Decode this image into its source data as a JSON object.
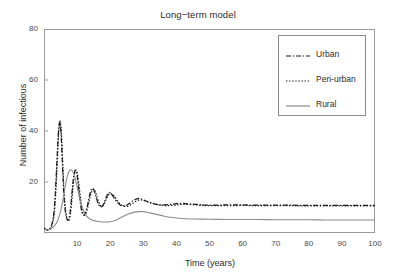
{
  "chart_data": {
    "type": "line",
    "title": "Long−term model",
    "xlabel": "Time (years)",
    "ylabel": "Number of infectious",
    "xlim": [
      0,
      100
    ],
    "ylim": [
      0,
      80
    ],
    "xticks": [
      10,
      20,
      30,
      40,
      50,
      60,
      70,
      80,
      90,
      100
    ],
    "yticks": [
      20,
      40,
      60,
      80
    ],
    "grid": false,
    "legend_position": "top-right",
    "series": [
      {
        "name": "Urban",
        "style": "dash-dot",
        "color": "#1a1a1a",
        "x": [
          0,
          0.5,
          1,
          1.5,
          2,
          2.5,
          3,
          3.3,
          3.6,
          3.9,
          4.2,
          4.5,
          4.8,
          5.1,
          5.4,
          5.7,
          6,
          6.4,
          6.8,
          7.2,
          7.6,
          8,
          8.4,
          8.8,
          9.2,
          9.6,
          10,
          10.5,
          11,
          11.5,
          12,
          12.5,
          13,
          13.5,
          14,
          14.5,
          15,
          15.5,
          16,
          16.5,
          17,
          17.5,
          18,
          18.5,
          19,
          19.5,
          20,
          21,
          22,
          23,
          24,
          25,
          26,
          27,
          28,
          29,
          30,
          32,
          34,
          36,
          38,
          40,
          42,
          45,
          48,
          50,
          55,
          60,
          65,
          70,
          75,
          80,
          85,
          90,
          95,
          100
        ],
        "y": [
          2.0,
          1.5,
          1.2,
          1.4,
          2.2,
          4.0,
          8.0,
          13.0,
          20.0,
          28.0,
          36.0,
          41.5,
          43.5,
          40.0,
          32.0,
          23.0,
          15.0,
          9.0,
          6.0,
          5.0,
          6.0,
          9.5,
          15.0,
          20.5,
          23.8,
          24.6,
          22.5,
          17.0,
          11.5,
          8.0,
          7.0,
          7.8,
          10.0,
          13.0,
          16.0,
          17.4,
          17.0,
          15.2,
          13.0,
          11.2,
          10.3,
          10.4,
          11.4,
          13.0,
          14.6,
          15.6,
          15.8,
          14.2,
          12.3,
          11.0,
          10.6,
          10.9,
          11.8,
          12.8,
          13.4,
          13.5,
          13.0,
          11.9,
          11.2,
          11.0,
          11.2,
          11.5,
          11.6,
          11.3,
          11.0,
          10.9,
          11.0,
          11.0,
          10.9,
          10.9,
          10.9,
          10.8,
          10.8,
          10.8,
          10.8,
          10.8
        ]
      },
      {
        "name": "Peri-urban",
        "style": "dotted",
        "color": "#1a1a1a",
        "x": [
          0,
          0.5,
          1,
          1.5,
          2,
          2.5,
          3,
          3.3,
          3.6,
          3.9,
          4.2,
          4.5,
          4.8,
          5.1,
          5.4,
          5.7,
          6,
          6.4,
          6.8,
          7.2,
          7.6,
          8,
          8.4,
          8.8,
          9.2,
          9.6,
          10,
          10.5,
          11,
          11.5,
          12,
          12.5,
          13,
          13.5,
          14,
          14.5,
          15,
          15.5,
          16,
          16.5,
          17,
          17.5,
          18,
          18.5,
          19,
          19.5,
          20,
          21,
          22,
          23,
          24,
          25,
          26,
          27,
          28,
          29,
          30,
          32,
          34,
          36,
          38,
          40,
          42,
          45,
          48,
          50,
          55,
          60,
          65,
          70,
          75,
          80,
          85,
          90,
          95,
          100
        ],
        "y": [
          1.8,
          1.3,
          1.1,
          1.3,
          2.0,
          3.4,
          6.5,
          10.5,
          17.0,
          25.0,
          33.5,
          40.5,
          43.8,
          42.0,
          35.5,
          26.5,
          17.5,
          10.5,
          6.5,
          4.8,
          5.2,
          7.5,
          12.5,
          18.5,
          22.8,
          24.5,
          23.8,
          19.5,
          13.8,
          9.2,
          7.2,
          7.2,
          8.8,
          11.6,
          14.6,
          16.6,
          17.2,
          16.2,
          14.2,
          12.2,
          10.8,
          10.4,
          11.0,
          12.3,
          13.8,
          15.0,
          15.5,
          14.8,
          13.0,
          11.5,
          10.6,
          10.4,
          10.9,
          11.8,
          12.6,
          13.0,
          12.8,
          12.0,
          11.2,
          10.8,
          10.8,
          11.0,
          11.2,
          11.1,
          10.8,
          10.7,
          10.7,
          10.8,
          10.7,
          10.7,
          10.7,
          10.6,
          10.6,
          10.6,
          10.6,
          10.6
        ]
      },
      {
        "name": "Rural",
        "style": "solid",
        "color": "#8c8c8c",
        "x": [
          0,
          1,
          2,
          3,
          4,
          5,
          5.5,
          6,
          6.5,
          7,
          7.5,
          8,
          8.5,
          9,
          9.5,
          10,
          10.5,
          11,
          12,
          13,
          14,
          15,
          16,
          17,
          18,
          19,
          20,
          21,
          22,
          23,
          24,
          25,
          26,
          27,
          28,
          29,
          30,
          31,
          32,
          34,
          36,
          38,
          40,
          45,
          50,
          55,
          60,
          65,
          70,
          75,
          80,
          85,
          90,
          95,
          100
        ],
        "y": [
          1.5,
          1.2,
          1.6,
          2.6,
          4.5,
          8.5,
          11.5,
          15.0,
          19.0,
          22.0,
          24.0,
          24.8,
          24.5,
          23.2,
          21.0,
          18.2,
          15.2,
          12.5,
          8.6,
          6.4,
          5.4,
          4.9,
          4.6,
          4.4,
          4.3,
          4.3,
          4.4,
          4.7,
          5.2,
          5.9,
          6.6,
          7.2,
          7.7,
          8.1,
          8.3,
          8.4,
          8.4,
          8.2,
          7.9,
          7.3,
          6.7,
          6.2,
          5.9,
          5.5,
          5.4,
          5.3,
          5.3,
          5.3,
          5.2,
          5.2,
          5.2,
          5.1,
          5.1,
          5.1,
          5.1
        ]
      }
    ]
  },
  "legend": {
    "items": [
      {
        "label": "Urban",
        "style": "dash-dot"
      },
      {
        "label": "Peri-urban",
        "style": "dotted"
      },
      {
        "label": "Rural",
        "style": "solid"
      }
    ]
  },
  "colors": {
    "axis": "#9a9a9a",
    "dark_line": "#1a1a1a",
    "gray_line": "#8c8c8c",
    "text": "#2b2b2b",
    "background": "#ffffff"
  }
}
